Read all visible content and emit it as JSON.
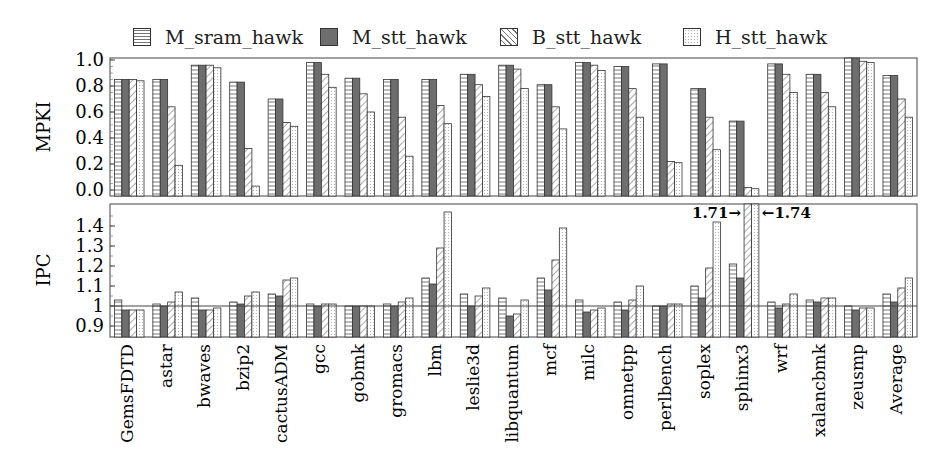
{
  "legend": [
    {
      "name": "M_sram_hawk",
      "pattern": "hstripe"
    },
    {
      "name": "M_stt_hawk",
      "pattern": "solid"
    },
    {
      "name": "B_stt_hawk",
      "pattern": "diag"
    },
    {
      "name": "H_stt_hawk",
      "pattern": "dots"
    }
  ],
  "annotations": {
    "left": "1.71→",
    "right": "←1.74"
  },
  "chart_data": [
    {
      "type": "bar",
      "title": "",
      "ylabel": "MPKI",
      "xlabel": "",
      "ylim": [
        0.0,
        1.0
      ],
      "yticks": [
        "0.0",
        "0.2",
        "0.4",
        "0.6",
        "0.8",
        "1.0"
      ],
      "grid": false,
      "legend_position": "top",
      "categories": [
        "GemsFDTD",
        "astar",
        "bwaves",
        "bzip2",
        "cactusADM",
        "gcc",
        "gobmk",
        "gromacs",
        "lbm",
        "leslie3d",
        "libquantum",
        "mcf",
        "milc",
        "omnetpp",
        "perlbench",
        "soplex",
        "sphinx3",
        "wrf",
        "xalancbmk",
        "zeusmp",
        "Average"
      ],
      "series": [
        {
          "name": "M_sram_hawk",
          "values": [
            0.85,
            0.85,
            0.96,
            0.83,
            0.7,
            0.98,
            0.86,
            0.85,
            0.85,
            0.89,
            0.96,
            0.81,
            0.98,
            0.95,
            0.97,
            0.78,
            0.53,
            0.97,
            0.89,
            1.02,
            0.88
          ]
        },
        {
          "name": "M_stt_hawk",
          "values": [
            0.85,
            0.85,
            0.96,
            0.83,
            0.7,
            0.98,
            0.86,
            0.85,
            0.85,
            0.89,
            0.96,
            0.81,
            0.98,
            0.95,
            0.97,
            0.78,
            0.53,
            0.97,
            0.89,
            1.02,
            0.88
          ]
        },
        {
          "name": "B_stt_hawk",
          "values": [
            0.85,
            0.64,
            0.96,
            0.32,
            0.52,
            0.89,
            0.74,
            0.56,
            0.65,
            0.81,
            0.93,
            0.64,
            0.96,
            0.78,
            0.22,
            0.56,
            0.02,
            0.89,
            0.75,
            0.99,
            0.7
          ]
        },
        {
          "name": "H_stt_hawk",
          "values": [
            0.84,
            0.19,
            0.94,
            0.03,
            0.49,
            0.79,
            0.6,
            0.26,
            0.51,
            0.72,
            0.78,
            0.47,
            0.92,
            0.56,
            0.21,
            0.31,
            0.01,
            0.75,
            0.64,
            0.98,
            0.56
          ]
        }
      ]
    },
    {
      "type": "bar",
      "title": "",
      "ylabel": "IPC",
      "xlabel": "",
      "ylim": [
        0.85,
        1.5
      ],
      "yticks": [
        "0.9",
        "1",
        "1.1",
        "1.2",
        "1.3",
        "1.4"
      ],
      "baseline": 1.0,
      "grid": false,
      "categories": [
        "GemsFDTD",
        "astar",
        "bwaves",
        "bzip2",
        "cactusADM",
        "gcc",
        "gobmk",
        "gromacs",
        "lbm",
        "leslie3d",
        "libquantum",
        "mcf",
        "milc",
        "omnetpp",
        "perlbench",
        "soplex",
        "sphinx3",
        "wrf",
        "xalancbmk",
        "zeusmp",
        "Average"
      ],
      "series": [
        {
          "name": "M_sram_hawk",
          "values": [
            1.03,
            1.01,
            1.04,
            1.02,
            1.06,
            1.01,
            1.0,
            1.01,
            1.14,
            1.06,
            1.04,
            1.14,
            1.03,
            1.02,
            1.0,
            1.1,
            1.21,
            1.02,
            1.03,
            1.0,
            1.06
          ]
        },
        {
          "name": "M_stt_hawk",
          "values": [
            0.98,
            1.0,
            0.98,
            1.01,
            1.05,
            1.0,
            1.0,
            1.0,
            1.11,
            1.0,
            0.95,
            1.08,
            0.97,
            0.98,
            1.0,
            1.04,
            1.14,
            0.99,
            1.02,
            0.98,
            1.02
          ]
        },
        {
          "name": "B_stt_hawk",
          "values": [
            0.98,
            1.02,
            0.98,
            1.05,
            1.13,
            1.01,
            1.0,
            1.02,
            1.29,
            1.05,
            0.96,
            1.23,
            0.98,
            1.03,
            1.01,
            1.19,
            1.71,
            1.01,
            1.04,
            0.99,
            1.09
          ]
        },
        {
          "name": "H_stt_hawk",
          "values": [
            0.98,
            1.07,
            0.99,
            1.07,
            1.14,
            1.01,
            1.0,
            1.04,
            1.47,
            1.09,
            1.03,
            1.39,
            0.99,
            1.1,
            1.01,
            1.42,
            1.74,
            1.06,
            1.04,
            0.99,
            1.14
          ]
        }
      ]
    }
  ]
}
